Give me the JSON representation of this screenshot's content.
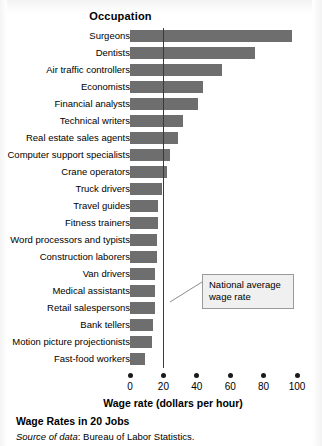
{
  "header": {
    "column_header": "Occupation"
  },
  "annotation": {
    "line1": "National average",
    "line2": "wage rate",
    "value": 20
  },
  "caption": {
    "title": "Wage Rates in 20 Jobs",
    "source_label": "Source of data",
    "source_text": ": Bureau of Labor Statistics."
  },
  "colors": {
    "bar": "#6e6e6e",
    "average_line": "#3a3a3a",
    "callout_border": "#9a9a9a",
    "callout_fill": "#f0f0f0",
    "text": "#000000"
  },
  "chart_data": {
    "type": "bar",
    "orientation": "horizontal",
    "title": "Wage Rates in 20 Jobs",
    "xlabel": "Wage rate (dollars per hour)",
    "ylabel": "Occupation",
    "xlim": [
      0,
      100
    ],
    "xticks": [
      0,
      20,
      40,
      60,
      80,
      100
    ],
    "xtick_labels": [
      "0",
      "20",
      "40",
      "60",
      "80",
      "100"
    ],
    "grid": false,
    "legend": "none",
    "annotations": [
      {
        "text": "National average wage rate",
        "type": "vertical-reference-line",
        "x": 20
      }
    ],
    "categories": [
      "Surgeons",
      "Dentists",
      "Air traffic controllers",
      "Economists",
      "Financial analysts",
      "Technical writers",
      "Real estate sales agents",
      "Computer support specialists",
      "Crane operators",
      "Truck drivers",
      "Travel guides",
      "Fitness trainers",
      "Word processors and typists",
      "Construction laborers",
      "Van drivers",
      "Medical assistants",
      "Retail salespersons",
      "Bank tellers",
      "Motion picture projectionists",
      "Fast-food workers"
    ],
    "values": [
      97,
      75,
      55,
      44,
      41,
      32,
      29,
      24,
      22,
      19,
      17,
      17,
      16,
      16,
      15,
      15,
      15,
      14,
      13,
      9
    ]
  }
}
